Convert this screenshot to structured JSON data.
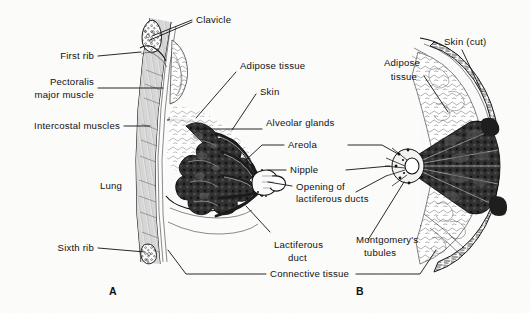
{
  "figure": {
    "background_color": "#fbfbfa",
    "ink_color": "#111111",
    "panels": [
      {
        "id": "A",
        "label": "A",
        "view": "sagittal-section",
        "x": 113,
        "y": 290
      },
      {
        "id": "B",
        "label": "B",
        "view": "anterior-cut-away",
        "x": 360,
        "y": 290
      }
    ]
  },
  "labels": {
    "clavicle": "Clavicle",
    "first_rib": "First rib",
    "pectoralis_major_muscle_line1": "Pectoralis",
    "pectoralis_major_muscle_line2": "major muscle",
    "intercostal_muscles": "Intercostal muscles",
    "lung": "Lung",
    "sixth_rib": "Sixth rib",
    "adipose_tissue_left": "Adipose tissue",
    "skin": "Skin",
    "alveolar_glands": "Alveolar glands",
    "areola": "Areola",
    "nipple": "Nipple",
    "opening_of_lactiferous_ducts_line1": "Opening of",
    "opening_of_lactiferous_ducts_line2": "lactiferous ducts",
    "lactiferous_duct_line1": "Lactiferous",
    "lactiferous_duct_line2": "duct",
    "montgomerys_tubules_line1": "Montgomery's",
    "montgomerys_tubules_line2": "tubules",
    "connective_tissue": "Connective tissue",
    "adipose_tissue_right_line1": "Adipose",
    "adipose_tissue_right_line2": "tissue",
    "skin_cut": "Skin (cut)"
  },
  "structures": [
    "clavicle",
    "first rib",
    "pectoralis major muscle",
    "intercostal muscles",
    "lung",
    "sixth rib",
    "adipose tissue",
    "skin",
    "alveolar glands",
    "areola",
    "nipple",
    "opening of lactiferous ducts",
    "lactiferous duct",
    "Montgomery's tubules",
    "connective tissue",
    "skin (cut)"
  ]
}
